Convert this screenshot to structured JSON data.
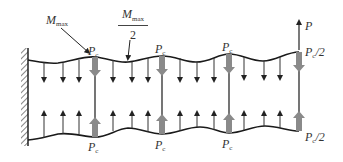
{
  "diagram": {
    "type": "structural-mechanics",
    "colors": {
      "line": "#1a1a1a",
      "thick_arrow": "#8a8a8a",
      "thin_arrow": "#333333",
      "hatch": "#333333"
    },
    "labels": {
      "m_max": "M",
      "m_max_sub": "max",
      "m_half_num": "M",
      "m_half_sub": "max",
      "m_half_den": "2",
      "p_top": "P",
      "pc": "P",
      "pc_sub": "c",
      "pc_half_top": "P",
      "pc_half_top_sub": "c",
      "pc_half_top_suffix": "/2",
      "pc_half_bottom": "P",
      "pc_half_bottom_sub": "c",
      "pc_half_bottom_suffix": "/2"
    },
    "top_pc_labels": [
      {
        "x": 88,
        "y": 45
      },
      {
        "x": 155,
        "y": 43
      },
      {
        "x": 222,
        "y": 41
      }
    ],
    "bottom_pc_labels": [
      {
        "x": 88,
        "y": 141
      },
      {
        "x": 155,
        "y": 139
      },
      {
        "x": 222,
        "y": 138
      }
    ],
    "pc_positions_x": [
      95,
      162,
      229
    ],
    "end_x": 299,
    "distributed_down_arrows_x": [
      44,
      63,
      79,
      113,
      132,
      148,
      180,
      197,
      214,
      244,
      264,
      280
    ],
    "distributed_up_arrows_x": [
      44,
      63,
      79,
      113,
      132,
      148,
      180,
      197,
      214,
      244,
      264,
      280
    ]
  }
}
